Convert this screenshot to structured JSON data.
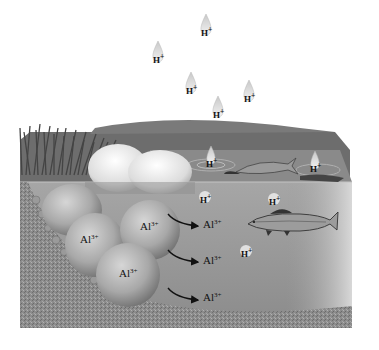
{
  "diagram": {
    "colors": {
      "background": "#ffffff",
      "water": "#9a9a9a",
      "water_surface": "#7c7c7c",
      "soil": "#8a8a8a",
      "rock": "#b4b4b4",
      "grass": "#555555",
      "fish": "#444444",
      "text": "#111111"
    },
    "rain_drops": [
      {
        "label": "H",
        "charge": "+",
        "x": 206,
        "y": 30
      },
      {
        "label": "H",
        "charge": "+",
        "x": 158,
        "y": 57
      },
      {
        "label": "H",
        "charge": "+",
        "x": 191,
        "y": 88
      },
      {
        "label": "H",
        "charge": "+",
        "x": 249,
        "y": 96
      },
      {
        "label": "H",
        "charge": "+",
        "x": 218,
        "y": 112
      }
    ],
    "surface_ions": [
      {
        "label": "H",
        "charge": "+",
        "x": 211,
        "y": 162
      },
      {
        "label": "H",
        "charge": "+",
        "x": 315,
        "y": 167
      }
    ],
    "water_ions": [
      {
        "label": "H",
        "charge": "+",
        "x": 205,
        "y": 197
      },
      {
        "label": "H",
        "charge": "+",
        "x": 274,
        "y": 199
      },
      {
        "label": "H",
        "charge": "+",
        "x": 246,
        "y": 251
      }
    ],
    "rock_ions": [
      {
        "label": "Al",
        "charge": "3+",
        "x": 82,
        "y": 240
      },
      {
        "label": "Al",
        "charge": "3+",
        "x": 142,
        "y": 226
      },
      {
        "label": "Al",
        "charge": "3+",
        "x": 121,
        "y": 274
      }
    ],
    "released_ions": [
      {
        "label": "Al",
        "charge": "3+",
        "x": 204,
        "y": 224
      },
      {
        "label": "Al",
        "charge": "3+",
        "x": 204,
        "y": 260
      },
      {
        "label": "Al",
        "charge": "3+",
        "x": 204,
        "y": 297
      }
    ]
  }
}
